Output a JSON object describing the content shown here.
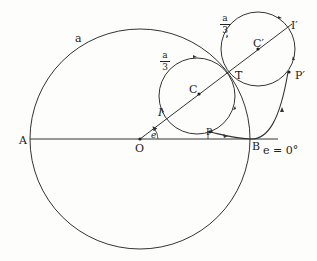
{
  "diagram": {
    "colors": {
      "stroke": "#333333",
      "background": "#fdfdfc",
      "text": "#222222"
    },
    "labels": {
      "big_radius": "a",
      "A": "A",
      "O": "O",
      "B": "B",
      "P": "P",
      "I": "I",
      "C": "C",
      "T": "T",
      "C_prime": "C′",
      "I_prime": "I′",
      "P_prime": "P′",
      "angle": "e",
      "angle_condition": "e = 0°",
      "small_radius_1": {
        "num": "a",
        "den": "3"
      },
      "small_radius_2": {
        "num": "a",
        "den": "3"
      }
    },
    "shapes": {
      "big_circle": {
        "cx": 140,
        "cy": 139,
        "r": 110
      },
      "circle_C": {
        "cx": 197,
        "cy": 96,
        "r": 38
      },
      "circle_C_prime": {
        "cx": 258,
        "cy": 49,
        "r": 37
      },
      "baseline": {
        "x1": 30,
        "y1": 139,
        "x2": 278,
        "y2": 139
      },
      "radial_line": {
        "x1": 140,
        "y1": 139,
        "x2": 292,
        "y2": 24
      }
    }
  }
}
